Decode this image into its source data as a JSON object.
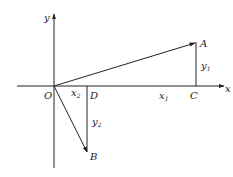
{
  "diagram": {
    "type": "vector-decomposition",
    "colors": {
      "stroke": "#222222",
      "background": "#ffffff"
    },
    "axes": {
      "x_label": "x",
      "y_label": "y",
      "origin_label": "O"
    },
    "points": {
      "A": {
        "label": "A"
      },
      "B": {
        "label": "B"
      },
      "C": {
        "label": "C"
      },
      "D": {
        "label": "D"
      }
    },
    "segment_labels": {
      "x1": {
        "base": "x",
        "sub": "1"
      },
      "y1": {
        "base": "y",
        "sub": "1"
      },
      "x2": {
        "base": "x",
        "sub": "2"
      },
      "y2": {
        "base": "y",
        "sub": "2"
      }
    },
    "vectors": [
      {
        "from": "O",
        "to": "A"
      },
      {
        "from": "O",
        "to": "B"
      }
    ],
    "perpendiculars": [
      {
        "from": "A",
        "to": "C",
        "label": "y1"
      },
      {
        "from": "D",
        "to": "B",
        "label": "y2"
      }
    ]
  }
}
